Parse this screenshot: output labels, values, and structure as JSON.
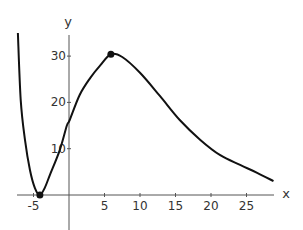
{
  "chart_data": {
    "type": "line",
    "title": "",
    "xlabel": "x",
    "ylabel": "y",
    "xlim": [
      -7.3,
      29
    ],
    "ylim": [
      -11,
      35
    ],
    "grid": false,
    "legend": null,
    "x_ticks": [
      -5,
      5,
      10,
      15,
      20,
      25
    ],
    "y_ticks": [
      10,
      20,
      30
    ],
    "series": [
      {
        "name": "f(x)",
        "color": "#111111",
        "x": [
          -7.2,
          -6.8,
          -6.2,
          -5.5,
          -4.8,
          -4.1,
          -3.4,
          -2.7,
          -1.3,
          -0.3,
          0.1,
          1.5,
          3.0,
          4.4,
          5.9,
          7.5,
          10.0,
          12.8,
          15.6,
          18.5,
          21.3,
          24.1,
          26.5,
          28.8
        ],
        "y": [
          35,
          20.5,
          11.9,
          5.4,
          1.5,
          0,
          1.6,
          4.3,
          9.7,
          15.0,
          16.2,
          21.6,
          25.3,
          28.0,
          30.4,
          29.8,
          26.4,
          21.4,
          16.2,
          11.9,
          8.6,
          6.5,
          4.8,
          3.0
        ]
      }
    ],
    "annotations": [
      {
        "type": "point",
        "label": "local minimum",
        "x": -4.1,
        "y": 0
      },
      {
        "type": "point",
        "label": "local maximum",
        "x": 5.9,
        "y": 30.4
      }
    ]
  }
}
